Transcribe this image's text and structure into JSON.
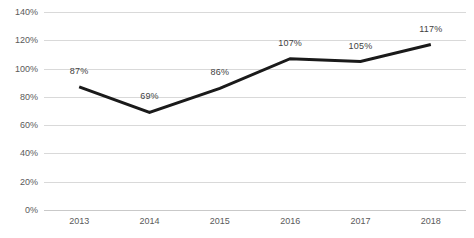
{
  "chart_data": {
    "type": "line",
    "title": "",
    "subtitle": "",
    "xlabel": "",
    "ylabel": "",
    "categories": [
      "2013",
      "2014",
      "2015",
      "2016",
      "2017",
      "2018"
    ],
    "values": [
      87,
      69,
      86,
      107,
      105,
      117
    ],
    "point_labels": [
      "87%",
      "69%",
      "86%",
      "107%",
      "105%",
      "117%"
    ],
    "ylim": [
      0,
      140
    ],
    "ytick_values": [
      0,
      20,
      40,
      60,
      80,
      100,
      120,
      140
    ],
    "ytick_labels": [
      "0%",
      "20%",
      "40%",
      "60%",
      "80%",
      "100%",
      "120%",
      "140%"
    ],
    "grid": true,
    "legend": false,
    "legend_position": "none",
    "series": [
      {
        "name": "",
        "values": [
          87,
          69,
          86,
          107,
          105,
          117
        ],
        "color": "#1a1a1a",
        "line_width": 3,
        "markers": false
      }
    ],
    "colors": {
      "line": "#1a1a1a",
      "gridline": "#d9d9d9",
      "axis": "#c9c9c9",
      "tick_text": "#5a5a5a",
      "label_text": "#3f3f3f",
      "background": "#ffffff"
    }
  }
}
